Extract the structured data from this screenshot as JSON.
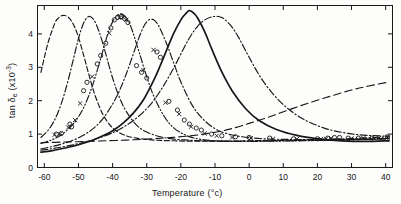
{
  "figure": {
    "background": "#fdfdfc",
    "ink": "#181818"
  },
  "chart_data": {
    "type": "line",
    "title": "",
    "xlabel": "Temperature (°c)",
    "ylabel": "tan δe (x10-3)",
    "ylabel_parts": {
      "base": "tan ",
      "symbol": "δ",
      "subscript": "e",
      "units_open": " (x10",
      "units_exp": "-3",
      "units_close": ")"
    },
    "xlabel_parts": {
      "base": "Temperature ",
      "units": "(°c)"
    },
    "xlim": [
      -62,
      42
    ],
    "ylim": [
      0,
      4.85
    ],
    "xticks": [
      -60,
      -50,
      -40,
      -30,
      -20,
      -10,
      0,
      10,
      20,
      30,
      40
    ],
    "xticklabels": [
      "-60",
      "-50",
      "-40",
      "-30",
      "-20",
      "-10",
      "0",
      "10",
      "20",
      "30",
      "40"
    ],
    "yticks": [
      0,
      1,
      2,
      3,
      4
    ],
    "yticklabels": [
      "0",
      "1",
      "2",
      "3",
      "4"
    ],
    "grid": false,
    "legend": "none",
    "tick_direction": "in",
    "frame": "box",
    "series": [
      {
        "name": "curve-1",
        "style": "dashed",
        "peak_x": -54.0,
        "peak_y": 4.55,
        "x": [
          -61,
          -59,
          -57,
          -56,
          -55,
          -54,
          -53,
          -52,
          -51,
          -50,
          -49,
          -48,
          -47,
          -46,
          -45,
          -43,
          -41,
          -39,
          -36,
          -33,
          -30,
          -26,
          -22,
          -18,
          -14,
          -10,
          -5,
          0,
          8,
          16,
          24,
          32,
          41
        ],
        "y": [
          2.85,
          3.7,
          4.3,
          4.46,
          4.54,
          4.55,
          4.5,
          4.38,
          4.18,
          3.9,
          3.55,
          3.18,
          2.8,
          2.44,
          2.12,
          1.62,
          1.3,
          1.1,
          0.95,
          0.88,
          0.84,
          0.81,
          0.8,
          0.79,
          0.79,
          0.79,
          0.79,
          0.8,
          0.81,
          0.82,
          0.83,
          0.85,
          0.87
        ]
      },
      {
        "name": "curve-2",
        "style": "dash-dot",
        "peak_x": -47.0,
        "peak_y": 4.52,
        "x": [
          -61,
          -59,
          -57,
          -55,
          -53,
          -51,
          -50,
          -49,
          -48,
          -47,
          -46,
          -45,
          -44,
          -43,
          -42,
          -40,
          -38,
          -36,
          -33,
          -30,
          -26,
          -22,
          -18,
          -14,
          -10,
          -5,
          0,
          8,
          16,
          24,
          32,
          41
        ],
        "y": [
          0.9,
          1.1,
          1.42,
          1.92,
          2.62,
          3.45,
          3.86,
          4.19,
          4.42,
          4.52,
          4.48,
          4.33,
          4.08,
          3.76,
          3.4,
          2.68,
          2.1,
          1.68,
          1.27,
          1.06,
          0.92,
          0.85,
          0.82,
          0.8,
          0.79,
          0.79,
          0.79,
          0.8,
          0.81,
          0.82,
          0.84,
          0.86
        ]
      },
      {
        "name": "curve-3",
        "style": "dash-dot-dot",
        "peak_x": -37.5,
        "peak_y": 4.6,
        "x": [
          -61,
          -58,
          -55,
          -52,
          -50,
          -48,
          -46,
          -44,
          -42,
          -41,
          -40,
          -39,
          -38,
          -37.5,
          -37,
          -36,
          -35,
          -34,
          -32,
          -30,
          -28,
          -25,
          -22,
          -18,
          -14,
          -10,
          -5,
          0,
          8,
          16,
          24,
          32,
          41
        ],
        "y": [
          0.72,
          0.82,
          0.98,
          1.25,
          1.52,
          1.9,
          2.42,
          3.08,
          3.8,
          4.12,
          4.36,
          4.52,
          4.59,
          4.6,
          4.58,
          4.48,
          4.3,
          4.03,
          3.38,
          2.72,
          2.15,
          1.55,
          1.18,
          0.94,
          0.84,
          0.8,
          0.78,
          0.78,
          0.79,
          0.8,
          0.82,
          0.84,
          0.86
        ]
      },
      {
        "name": "curve-4",
        "style": "dash-dot",
        "peak_x": -29.0,
        "peak_y": 4.44,
        "x": [
          -61,
          -58,
          -55,
          -52,
          -49,
          -46,
          -43,
          -40,
          -38,
          -36,
          -34,
          -33,
          -32,
          -31,
          -30,
          -29,
          -28,
          -27,
          -26,
          -24,
          -22,
          -20,
          -17,
          -14,
          -10,
          -6,
          -2,
          4,
          12,
          20,
          28,
          35,
          41
        ],
        "y": [
          0.56,
          0.62,
          0.7,
          0.8,
          0.94,
          1.14,
          1.44,
          1.9,
          2.3,
          2.8,
          3.38,
          3.68,
          3.96,
          4.2,
          4.36,
          4.44,
          4.42,
          4.32,
          4.14,
          3.66,
          3.1,
          2.56,
          1.92,
          1.5,
          1.16,
          1.0,
          0.92,
          0.86,
          0.84,
          0.84,
          0.86,
          0.89,
          0.92
        ]
      },
      {
        "name": "curve-5",
        "style": "solid",
        "peak_x": -17.5,
        "peak_y": 4.7,
        "x": [
          -61,
          -58,
          -55,
          -52,
          -49,
          -46,
          -43,
          -40,
          -37,
          -34,
          -31,
          -28,
          -26,
          -24,
          -22,
          -20,
          -19,
          -18,
          -17.5,
          -17,
          -16,
          -15,
          -13,
          -11,
          -8,
          -5,
          -1,
          3,
          8,
          14,
          20,
          27,
          34,
          41
        ],
        "y": [
          0.46,
          0.5,
          0.56,
          0.63,
          0.71,
          0.81,
          0.94,
          1.1,
          1.32,
          1.62,
          2.02,
          2.6,
          3.06,
          3.56,
          4.04,
          4.42,
          4.56,
          4.67,
          4.7,
          4.68,
          4.6,
          4.46,
          4.06,
          3.56,
          2.86,
          2.3,
          1.76,
          1.4,
          1.14,
          0.96,
          0.86,
          0.8,
          0.78,
          0.8
        ]
      },
      {
        "name": "curve-6",
        "style": "dash-dot",
        "peak_x": -9.0,
        "peak_y": 4.52,
        "x": [
          -61,
          -58,
          -55,
          -52,
          -49,
          -46,
          -43,
          -40,
          -37,
          -34,
          -31,
          -28,
          -25,
          -22,
          -19,
          -17,
          -15,
          -13,
          -11,
          -10,
          -9,
          -8,
          -7,
          -5,
          -3,
          0,
          4,
          9,
          15,
          22,
          29,
          35,
          41
        ],
        "y": [
          0.52,
          0.56,
          0.61,
          0.67,
          0.74,
          0.82,
          0.92,
          1.04,
          1.2,
          1.4,
          1.66,
          2.0,
          2.46,
          3.0,
          3.6,
          3.96,
          4.24,
          4.42,
          4.51,
          4.52,
          4.52,
          4.49,
          4.42,
          4.2,
          3.88,
          3.3,
          2.6,
          1.98,
          1.5,
          1.18,
          1.02,
          0.96,
          0.94
        ]
      },
      {
        "name": "curve-7-rising",
        "style": "long-dashed",
        "peak_x": 41,
        "peak_y": 2.55,
        "x": [
          -61,
          -55,
          -48,
          -42,
          -36,
          -30,
          -24,
          -18,
          -12,
          -6,
          0,
          6,
          12,
          18,
          24,
          30,
          35,
          41
        ],
        "y": [
          0.74,
          0.76,
          0.78,
          0.8,
          0.82,
          0.85,
          0.89,
          0.94,
          1.02,
          1.14,
          1.32,
          1.52,
          1.74,
          1.95,
          2.14,
          2.32,
          2.44,
          2.56
        ]
      }
    ],
    "markers": {
      "circle_label": "open-circle",
      "cross_label": "cross",
      "circles": [
        [
          -56.5,
          1.0
        ],
        [
          -55.0,
          1.02
        ],
        [
          -52.0,
          1.22
        ],
        [
          -52.5,
          1.3
        ],
        [
          -48.5,
          2.3
        ],
        [
          -47.5,
          2.55
        ],
        [
          -44.5,
          3.1
        ],
        [
          -43.5,
          3.35
        ],
        [
          -42.0,
          3.72
        ],
        [
          -40.5,
          4.18
        ],
        [
          -39.5,
          4.42
        ],
        [
          -38.5,
          4.5
        ],
        [
          -37.5,
          4.52
        ],
        [
          -36.5,
          4.46
        ],
        [
          -35.5,
          4.34
        ],
        [
          -33.0,
          3.05
        ],
        [
          -31.5,
          2.85
        ],
        [
          -30.0,
          2.68
        ],
        [
          -27.0,
          3.46
        ],
        [
          -26.0,
          3.3
        ],
        [
          -23.5,
          1.98
        ],
        [
          -21.0,
          1.72
        ],
        [
          -19.0,
          1.42
        ],
        [
          -17.5,
          1.3
        ],
        [
          -15.5,
          1.18
        ],
        [
          -14.0,
          1.12
        ],
        [
          -11.0,
          1.0
        ],
        [
          -8.0,
          0.95
        ],
        [
          -4.0,
          0.92
        ],
        [
          0.0,
          0.9
        ],
        [
          6.0,
          0.88
        ],
        [
          13.0,
          0.86
        ],
        [
          20.0,
          0.86
        ],
        [
          23.0,
          0.88
        ],
        [
          25.0,
          0.9
        ],
        [
          26.5,
          0.9
        ],
        [
          29.0,
          0.88
        ],
        [
          32.0,
          0.88
        ],
        [
          36.0,
          0.88
        ],
        [
          40.5,
          0.92
        ]
      ],
      "crosses": [
        [
          -57.0,
          0.98
        ],
        [
          -55.5,
          1.0
        ],
        [
          -53.0,
          1.2
        ],
        [
          -51.0,
          1.42
        ],
        [
          -49.5,
          1.92
        ],
        [
          -46.0,
          2.72
        ],
        [
          -41.0,
          4.02
        ],
        [
          -38.0,
          4.48
        ],
        [
          -37.0,
          4.5
        ],
        [
          -36.0,
          4.42
        ],
        [
          -31.0,
          2.92
        ],
        [
          -28.0,
          3.52
        ],
        [
          -24.5,
          1.94
        ],
        [
          -20.5,
          1.6
        ],
        [
          -17.0,
          1.22
        ],
        [
          -13.0,
          1.02
        ],
        [
          -9.5,
          0.95
        ],
        [
          -5.0,
          0.9
        ],
        [
          0.5,
          0.88
        ],
        [
          7.0,
          0.86
        ],
        [
          14.0,
          0.85
        ],
        [
          21.0,
          0.85
        ],
        [
          22.5,
          0.86
        ],
        [
          24.0,
          0.88
        ],
        [
          30.0,
          0.87
        ],
        [
          33.5,
          0.88
        ],
        [
          38.0,
          0.88
        ],
        [
          40.5,
          0.9
        ]
      ]
    }
  }
}
